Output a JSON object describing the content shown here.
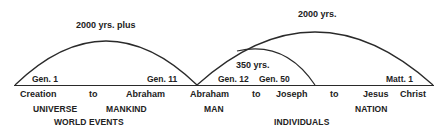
{
  "colors": {
    "line": "#2a2a2a",
    "text": "#222222",
    "background": "#ffffff"
  },
  "spans": [
    {
      "label": "2000 yrs. plus",
      "start_ref": "Gen. 1",
      "end_ref": "Gen. 11"
    },
    {
      "label": "350 yrs.",
      "start_ref": "Gen. 12",
      "end_ref": "Gen. 50"
    },
    {
      "label": "2000 yrs.",
      "end_ref": "Matt. 1"
    }
  ],
  "timeline": {
    "points": [
      "Creation",
      "to",
      "Abraham",
      "Abraham",
      "to",
      "Joseph",
      "to",
      "Jesus",
      "Christ"
    ]
  },
  "categories": {
    "universe": "UNIVERSE",
    "mankind": "MANKIND",
    "world_events": "WORLD EVENTS",
    "man": "MAN",
    "individuals": "INDIVIDUALS",
    "nation": "NATION"
  }
}
